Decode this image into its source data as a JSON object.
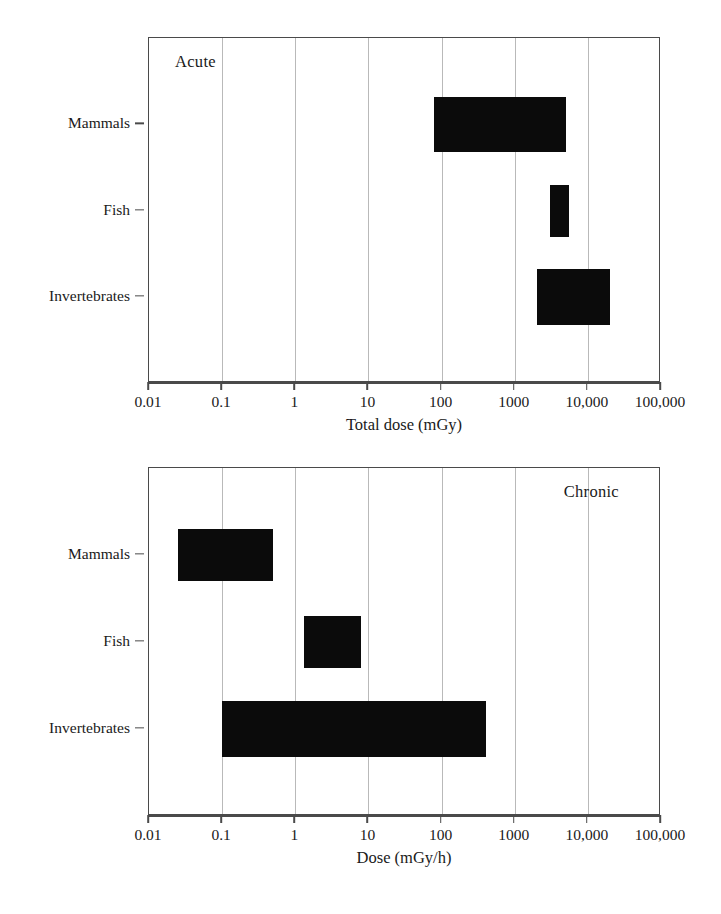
{
  "chart_data": [
    {
      "id": "acute",
      "type": "bar",
      "orientation": "horizontal",
      "subtype": "floating-range-bar",
      "title": "Acute",
      "panel_label": "Acute",
      "panel_label_position": "top-left",
      "xlabel": "Total dose (mGy)",
      "ylabel": "",
      "xscale": "log",
      "xlim": [
        0.01,
        100000
      ],
      "xticks": [
        0.01,
        0.1,
        1,
        10,
        100,
        1000,
        10000,
        100000
      ],
      "xticklabels": [
        "0.01",
        "0.1",
        "1",
        "10",
        "100",
        "1000",
        "10,000",
        "100,000"
      ],
      "grid": "vertical",
      "legend": "none",
      "categories": [
        "Mammals",
        "Fish",
        "Invertebrates"
      ],
      "ranges": [
        {
          "category": "Mammals",
          "low": 80,
          "high": 5000
        },
        {
          "category": "Fish",
          "low": 3000,
          "high": 5500
        },
        {
          "category": "Invertebrates",
          "low": 2000,
          "high": 20000
        }
      ],
      "bar_color": "#0b0b0b"
    },
    {
      "id": "chronic",
      "type": "bar",
      "orientation": "horizontal",
      "subtype": "floating-range-bar",
      "title": "Chronic",
      "panel_label": "Chronic",
      "panel_label_position": "top-right",
      "xlabel": "Dose (mGy/h)",
      "ylabel": "",
      "xscale": "log",
      "xlim": [
        0.01,
        100000
      ],
      "xticks": [
        0.01,
        0.1,
        1,
        10,
        100,
        1000,
        10000,
        100000
      ],
      "xticklabels": [
        "0.01",
        "0.1",
        "1",
        "10",
        "100",
        "1000",
        "10,000",
        "100,000"
      ],
      "grid": "vertical",
      "legend": "none",
      "categories": [
        "Mammals",
        "Fish",
        "Invertebrates"
      ],
      "ranges": [
        {
          "category": "Mammals",
          "low": 0.025,
          "high": 0.5
        },
        {
          "category": "Fish",
          "low": 1.3,
          "high": 8
        },
        {
          "category": "Invertebrates",
          "low": 0.1,
          "high": 400
        }
      ],
      "bar_color": "#0b0b0b"
    }
  ],
  "acute": {
    "panel_label": "Acute",
    "xtitle": "Total dose (mGy)",
    "categories": [
      "Mammals",
      "Fish",
      "Invertebrates"
    ],
    "xticklabels": [
      "0.01",
      "0.1",
      "1",
      "10",
      "100",
      "1000",
      "10,000",
      "100,000"
    ]
  },
  "chronic": {
    "panel_label": "Chronic",
    "xtitle": "Dose (mGy/h)",
    "categories": [
      "Mammals",
      "Fish",
      "Invertebrates"
    ],
    "xticklabels": [
      "0.01",
      "0.1",
      "1",
      "10",
      "100",
      "1000",
      "10,000",
      "100,000"
    ]
  },
  "colors": {
    "bar": "#0b0b0b",
    "gridline": "#b9b9b9",
    "axis": "#4a4a4a",
    "text": "#1a1a1a",
    "background": "#ffffff"
  }
}
